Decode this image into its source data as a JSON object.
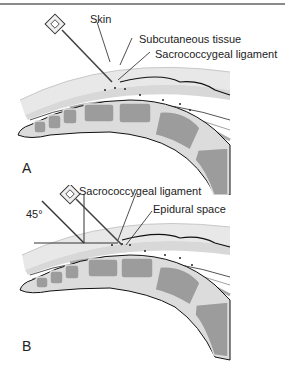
{
  "figure": {
    "panels": [
      {
        "id": "A",
        "letter": "A",
        "labels": {
          "skin": "Skin",
          "subcutaneous": "Subcutaneous tissue",
          "ligament": "Sacrococcygeal ligament"
        }
      },
      {
        "id": "B",
        "letter": "B",
        "labels": {
          "ligament": "Sacrococcygeal ligament",
          "epidural": "Epidural space",
          "angle": "45°"
        }
      }
    ],
    "colors": {
      "skin": "#e6e6e6",
      "bone": "#9a9a9a",
      "bone_rim": "#dcdcdc",
      "outline": "#1a1a1a",
      "label_text": "#222222"
    }
  }
}
